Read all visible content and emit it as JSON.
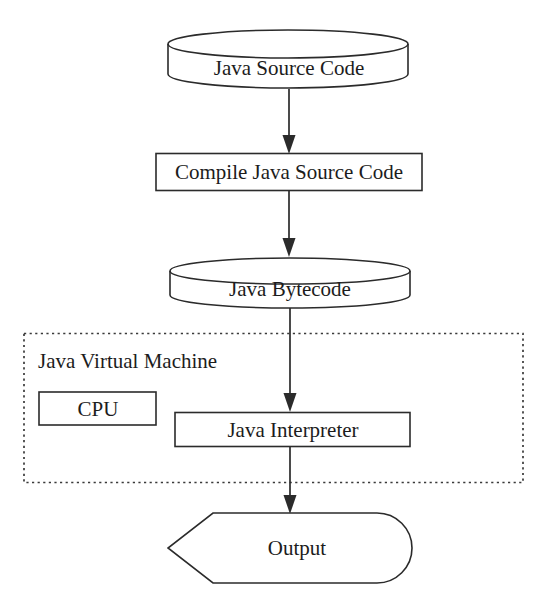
{
  "diagram": {
    "background_color": "#ffffff",
    "stroke_color": "#2b2b2b",
    "text_color": "#1c1c1c",
    "nodes": {
      "source_code": {
        "label": "Java Source Code",
        "shape": "cylinder"
      },
      "compile": {
        "label": "Compile Java Source Code",
        "shape": "rectangle"
      },
      "bytecode": {
        "label": "Java Bytecode",
        "shape": "cylinder"
      },
      "jvm": {
        "label": "Java Virtual Machine",
        "shape": "dotted-rectangle"
      },
      "cpu": {
        "label": "CPU",
        "shape": "rectangle"
      },
      "interpreter": {
        "label": "Java Interpreter",
        "shape": "rectangle"
      },
      "output": {
        "label": "Output",
        "shape": "output-banner"
      }
    },
    "edges": [
      {
        "name": "source-to-compile",
        "from": "Java Source Code",
        "to": "Compile Java Source Code",
        "style": "solid-arrow"
      },
      {
        "name": "compile-to-bytecode",
        "from": "Compile Java Source Code",
        "to": "Java Bytecode",
        "style": "solid-arrow"
      },
      {
        "name": "bytecode-to-interpreter",
        "from": "Java Bytecode",
        "to": "Java Interpreter",
        "style": "solid-arrow"
      },
      {
        "name": "interpreter-to-output",
        "from": "Java Interpreter",
        "to": "Output",
        "style": "solid-arrow"
      }
    ]
  }
}
